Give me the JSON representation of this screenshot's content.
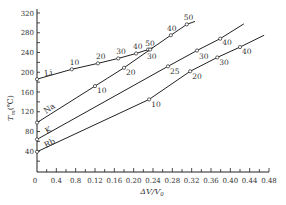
{
  "chart_data": {
    "type": "line",
    "title": "",
    "xlabel": "ΔV/V₀",
    "ylabel": "Tm (℃)",
    "xlim": [
      0,
      0.48
    ],
    "ylim": [
      0,
      320
    ],
    "x_tick_labels": [
      "0",
      "0.4",
      "0.8",
      "0.12",
      "0.16",
      "0.20",
      "0.24",
      "0.28",
      "0.32",
      "0.36",
      "0.40",
      "0.44",
      "0.48"
    ],
    "x_ticks": [
      0,
      0.04,
      0.08,
      0.12,
      0.16,
      0.2,
      0.24,
      0.28,
      0.32,
      0.36,
      0.4,
      0.44,
      0.48
    ],
    "y_ticks": [
      40,
      80,
      120,
      160,
      200,
      240,
      280,
      320
    ],
    "y_tick_labels": [
      "40",
      "80",
      "120",
      "160",
      "200",
      "240",
      "280",
      "320"
    ],
    "grid": false,
    "point_label_meaning": "pressure (kbar) annotations along each curve",
    "series": [
      {
        "name": "Li",
        "points": [
          {
            "x": 0.0,
            "y": 186,
            "label": ""
          },
          {
            "x": 0.072,
            "y": 206,
            "label": "10"
          },
          {
            "x": 0.126,
            "y": 218,
            "label": "20"
          },
          {
            "x": 0.168,
            "y": 228,
            "label": "30"
          },
          {
            "x": 0.205,
            "y": 238,
            "label": "40"
          },
          {
            "x": 0.23,
            "y": 246,
            "label": "50"
          }
        ],
        "end": {
          "x": 0.24,
          "y": 250
        }
      },
      {
        "name": "Na",
        "points": [
          {
            "x": 0.0,
            "y": 98,
            "label": ""
          },
          {
            "x": 0.12,
            "y": 172,
            "label": "10"
          },
          {
            "x": 0.18,
            "y": 209,
            "label": "20"
          },
          {
            "x": 0.234,
            "y": 246,
            "label": "30"
          },
          {
            "x": 0.277,
            "y": 275,
            "label": "40"
          },
          {
            "x": 0.31,
            "y": 297,
            "label": "50"
          }
        ],
        "end": {
          "x": 0.327,
          "y": 303
        }
      },
      {
        "name": "K",
        "points": [
          {
            "x": 0.0,
            "y": 64,
            "label": ""
          },
          {
            "x": 0.271,
            "y": 212,
            "label": "25"
          },
          {
            "x": 0.331,
            "y": 244,
            "label": "30"
          },
          {
            "x": 0.379,
            "y": 268,
            "label": "40"
          }
        ],
        "end": {
          "x": 0.428,
          "y": 298
        }
      },
      {
        "name": "Rb",
        "points": [
          {
            "x": 0.0,
            "y": 39,
            "label": ""
          },
          {
            "x": 0.232,
            "y": 145,
            "label": "10"
          },
          {
            "x": 0.317,
            "y": 202,
            "label": "20"
          },
          {
            "x": 0.373,
            "y": 230,
            "label": "30"
          },
          {
            "x": 0.42,
            "y": 251,
            "label": "40"
          }
        ],
        "end": {
          "x": 0.47,
          "y": 275
        }
      }
    ]
  },
  "axes": {
    "y_title_main": "T",
    "y_title_sub": "m",
    "y_title_unit": "(℃)",
    "x_title": "ΔV/V",
    "x_title_sub": "0"
  }
}
